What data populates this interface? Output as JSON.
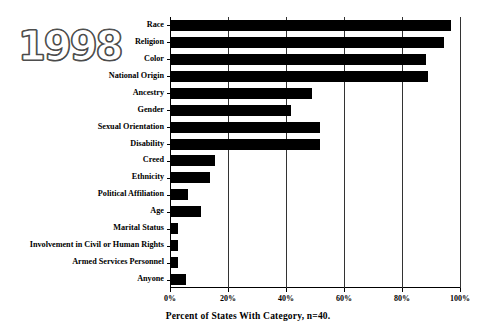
{
  "year_badge": "1998",
  "chart_data": {
    "type": "bar",
    "orientation": "horizontal",
    "title": "",
    "xlabel": "Percent of States With Category, n=40.",
    "ylabel": "",
    "xlim": [
      0,
      100
    ],
    "xticks": [
      "0%",
      "20%",
      "40%",
      "60%",
      "80%",
      "100%"
    ],
    "xtick_values": [
      0,
      20,
      40,
      60,
      80,
      100
    ],
    "grid": "vertical",
    "legend": "none",
    "bar_color": "#000000",
    "categories": [
      "Race",
      "Religion",
      "Color",
      "National Origin",
      "Ancestry",
      "Gender",
      "Sexual Orientation",
      "Disability",
      "Creed",
      "Ethnicity",
      "Political Affiliation",
      "Age",
      "Marital Status",
      "Involvement in Civil or Human Rights",
      "Armed Services Personnel",
      "Anyone"
    ],
    "values": [
      96.5,
      94.0,
      88.0,
      88.5,
      48.5,
      41.5,
      51.5,
      51.5,
      15.0,
      13.5,
      6.0,
      10.5,
      2.5,
      2.5,
      2.5,
      5.0
    ]
  }
}
